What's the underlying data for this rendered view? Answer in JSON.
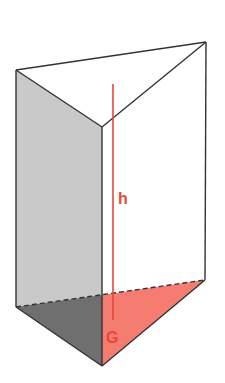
{
  "figure": {
    "labels": {
      "height": "h",
      "base": "G"
    },
    "colors": {
      "edge": "#333333",
      "left_face": "#c8c8c8",
      "bottom_dark": "#6e6e6e",
      "base_red": "#f47a6e",
      "accent_red": "#e8473a",
      "background": "#ffffff"
    }
  }
}
